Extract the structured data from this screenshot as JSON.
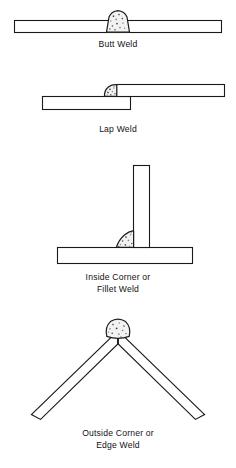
{
  "figure": {
    "background_color": "#ffffff",
    "line_color": "#1a1a1a",
    "bead_fill_color": "#f2f2f2",
    "speck_color": "#4a4a4a"
  },
  "joints": [
    {
      "id": "butt-weld",
      "caption_lines": [
        "Butt Weld"
      ],
      "caption_x": 118,
      "caption_y": 47,
      "description": "Two plates aligned edge to edge in one horizontal line with a convex weld bead bridging the seam at the top center.",
      "bead_shape": "rounded-trapezoid-crown"
    },
    {
      "id": "lap-weld",
      "caption_lines": [
        "Lap Weld"
      ],
      "caption_x": 118,
      "caption_y": 132,
      "description": "Two offset plates overlapping, upper plate to the right and lower plate to the left, with a fillet bead in the step between them.",
      "bead_shape": "fillet-teardrop"
    },
    {
      "id": "inside-corner-fillet-weld",
      "caption_lines": [
        "Inside Corner or",
        "Fillet Weld"
      ],
      "caption_x": 118,
      "caption_y": 280,
      "caption_line_height": 12,
      "description": "A vertical plate standing on a horizontal plate forming a T joint, with a concave fillet bead in the left inside corner.",
      "bead_shape": "fillet-concave-triangle"
    },
    {
      "id": "outside-corner-edge-weld",
      "caption_lines": [
        "Outside Corner or",
        "Edge Weld"
      ],
      "caption_x": 118,
      "caption_y": 436,
      "caption_line_height": 12,
      "description": "Two plates meeting at an apex forming an inverted V, with a rounded weld bead capping the outside corner at the top.",
      "bead_shape": "rounded-cap"
    }
  ]
}
